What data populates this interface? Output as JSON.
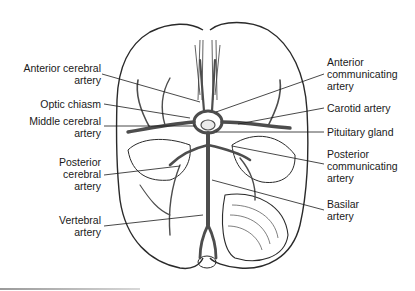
{
  "diagram": {
    "title_visible": false,
    "colors": {
      "line": "#2a2a2a",
      "vessel": "#555555",
      "background": "#ffffff"
    },
    "labels_left": [
      {
        "id": "anterior-cerebral-artery",
        "lines": [
          "Anterior cerebral",
          "artery"
        ]
      },
      {
        "id": "optic-chiasm",
        "lines": [
          "Optic chiasm"
        ]
      },
      {
        "id": "middle-cerebral-artery",
        "lines": [
          "Middle cerebral",
          "artery"
        ]
      },
      {
        "id": "posterior-cerebral-artery",
        "lines": [
          "Posterior",
          "cerebral",
          "artery"
        ]
      },
      {
        "id": "vertebral-artery",
        "lines": [
          "Vertebral",
          "artery"
        ]
      }
    ],
    "labels_right": [
      {
        "id": "anterior-communicating-artery",
        "lines": [
          "Anterior",
          "communicating",
          "artery"
        ]
      },
      {
        "id": "carotid-artery",
        "lines": [
          "Carotid artery"
        ]
      },
      {
        "id": "pituitary-gland",
        "lines": [
          "Pituitary gland"
        ]
      },
      {
        "id": "posterior-communicating-artery",
        "lines": [
          "Posterior",
          "communicating",
          "artery"
        ]
      },
      {
        "id": "basilar-artery",
        "lines": [
          "Basilar",
          "artery"
        ]
      }
    ]
  }
}
